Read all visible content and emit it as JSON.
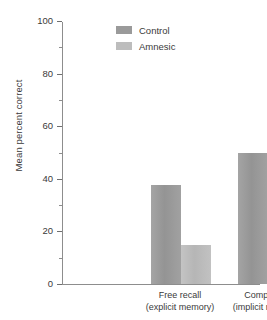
{
  "chart_data": {
    "type": "bar",
    "title": "",
    "xlabel": "",
    "ylabel": "Mean percent correct",
    "ylim": [
      0,
      100
    ],
    "ytick_major": [
      0,
      20,
      40,
      60,
      80,
      100
    ],
    "ytick_minor": [
      10,
      30,
      50,
      70,
      90
    ],
    "ytick_labels": [
      "0",
      "20",
      "40",
      "60",
      "80",
      "100"
    ],
    "grid": false,
    "legend_position": "top-center",
    "categories": [
      "Free recall\n(explicit memory)",
      "Completion\n(implicit memory)"
    ],
    "category_lines": [
      {
        "line1": "Free recall",
        "line2": "(explicit memory)"
      },
      {
        "line1": "Completion",
        "line2": "(implicit memory)"
      }
    ],
    "series": [
      {
        "name": "Control",
        "color": "#9a9a9a",
        "values": [
          37.5,
          50
        ]
      },
      {
        "name": "Amnesic",
        "color": "#bdbdbd",
        "values": [
          15,
          60
        ]
      }
    ]
  },
  "colors": {
    "control": "#9a9a9a",
    "amnesic": "#bdbdbd",
    "axis": "#8d8d8d",
    "text": "#3a3a3a",
    "background": "#ffffff"
  },
  "legend": {
    "items": [
      {
        "label": "Control",
        "swatch": "#9a9a9a"
      },
      {
        "label": "Amnesic",
        "swatch": "#bdbdbd"
      }
    ]
  }
}
